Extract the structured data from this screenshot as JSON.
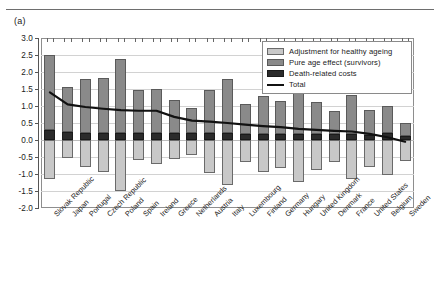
{
  "figure": {
    "panel_label": "(a)"
  },
  "legend": {
    "position": "top-right",
    "items": [
      {
        "label": "Adjustment for healthy ageing",
        "swatch": "light",
        "color": "#c8c8c8"
      },
      {
        "label": "Pure age effect (survivors)",
        "swatch": "mid",
        "color": "#8a8a8a"
      },
      {
        "label": "Death-related costs",
        "swatch": "dark",
        "color": "#2b2b2b"
      },
      {
        "label": "Total",
        "swatch": "line",
        "color": "#111111"
      }
    ]
  },
  "chart_data": {
    "type": "bar",
    "title": "",
    "subtitle": "",
    "xlabel": "",
    "ylabel": "",
    "ylim": [
      -2.0,
      3.0
    ],
    "ytick_labels": [
      "3.0",
      "2.5",
      "2.0",
      "1.5",
      "1.0",
      "0.5",
      "0.0",
      "-0.5",
      "-1.0",
      "-1.5",
      "-2.0"
    ],
    "ytick_values": [
      3.0,
      2.5,
      2.0,
      1.5,
      1.0,
      0.5,
      0.0,
      -0.5,
      -1.0,
      -1.5,
      -2.0
    ],
    "grid": true,
    "stacked": true,
    "categories": [
      "Slovak Republic",
      "Japan",
      "Portugal",
      "Czech Republic",
      "Poland",
      "Spain",
      "Ireland",
      "Greece",
      "Netherlands",
      "Austria",
      "Italy",
      "Luxembourg",
      "Finland",
      "Germany",
      "Hungary",
      "United Kingdom",
      "Denmark",
      "France",
      "United States",
      "Belgium",
      "Sweden"
    ],
    "series": [
      {
        "name": "Death-related costs",
        "color": "#2b2b2b",
        "values": [
          0.28,
          0.24,
          0.22,
          0.22,
          0.22,
          0.22,
          0.21,
          0.2,
          0.2,
          0.2,
          0.21,
          0.19,
          0.19,
          0.18,
          0.18,
          0.17,
          0.17,
          0.17,
          0.16,
          0.2,
          0.12
        ]
      },
      {
        "name": "Pure age effect (survivors)",
        "color": "#8a8a8a",
        "values": [
          2.22,
          1.32,
          1.56,
          1.6,
          2.15,
          1.26,
          1.29,
          0.97,
          0.73,
          1.28,
          1.57,
          0.86,
          1.1,
          0.97,
          1.33,
          0.94,
          0.68,
          1.16,
          0.72,
          0.79,
          0.37
        ]
      },
      {
        "name": "Adjustment for healthy ageing",
        "color": "#c8c8c8",
        "values": [
          -1.15,
          -0.52,
          -0.79,
          -0.93,
          -1.5,
          -0.6,
          -0.71,
          -0.56,
          -0.43,
          -0.97,
          -1.31,
          -0.66,
          -0.94,
          -0.83,
          -1.23,
          -0.88,
          -0.64,
          -1.15,
          -0.78,
          -1.03,
          -0.62
        ]
      }
    ],
    "total_line": {
      "name": "Total",
      "color": "#111111",
      "values": [
        1.4,
        1.05,
        0.97,
        0.92,
        0.88,
        0.86,
        0.86,
        0.68,
        0.57,
        0.54,
        0.5,
        0.45,
        0.41,
        0.38,
        0.33,
        0.3,
        0.27,
        0.25,
        0.18,
        0.08,
        -0.05
      ]
    }
  }
}
